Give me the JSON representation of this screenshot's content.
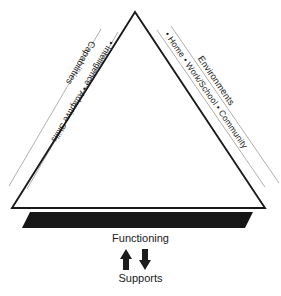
{
  "diagram": {
    "type": "triangle-framework",
    "background_color": "#ffffff",
    "ink_color": "#1a1a1a",
    "base_color": "#161616",
    "guide_color": "#9a9a9a",
    "left_side": {
      "heading": "Capabilities",
      "items_line": "•  Intelligence  •  Adaptive Skills",
      "items": [
        "Intelligence",
        "Adaptive Skills"
      ]
    },
    "right_side": {
      "heading": "Environments",
      "items_line": "•  Home  •  Work/School  •  Community",
      "items": [
        "Home",
        "Work/School",
        "Community"
      ]
    },
    "base": {
      "top_label": "Functioning",
      "bottom_label": "Supports",
      "up_arrow_icon": "arrow-up-icon",
      "down_arrow_icon": "arrow-down-icon"
    }
  }
}
